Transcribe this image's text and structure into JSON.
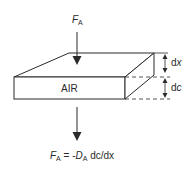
{
  "diagram": {
    "slab_label": "AIR",
    "flux_symbol": "F",
    "flux_subscript": "A",
    "thickness_label_prefix": "d",
    "thickness_label_var": "x",
    "conc_label_prefix": "d",
    "conc_label_var": "c",
    "equation": {
      "lhs_symbol": "F",
      "lhs_subscript": "A",
      "equals": " = -",
      "coef_symbol": "D",
      "coef_subscript": "A",
      "rest": " dc/dx"
    },
    "colors": {
      "line": "#2a2a2a",
      "background": "#ffffff"
    }
  }
}
